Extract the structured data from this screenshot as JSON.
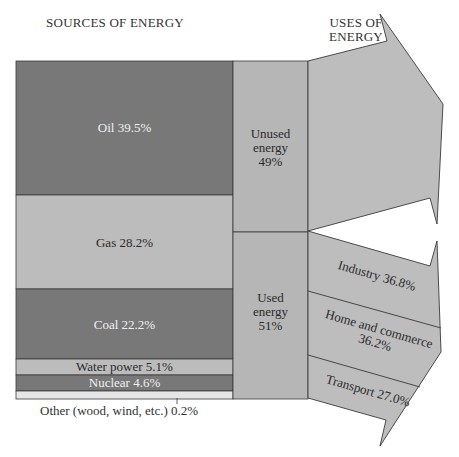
{
  "titles": {
    "sources": "SOURCES OF ENERGY",
    "uses_line1": "USES OF",
    "uses_line2": "ENERGY"
  },
  "sources": [
    {
      "name": "Oil",
      "label": "Oil 39.5%",
      "percent": 39.5,
      "color": "#787878"
    },
    {
      "name": "Gas",
      "label": "Gas 28.2%",
      "percent": 28.2,
      "color": "#bcbcbc"
    },
    {
      "name": "Coal",
      "label": "Coal 22.2%",
      "percent": 22.2,
      "color": "#787878"
    },
    {
      "name": "Water power",
      "label": "Water power 5.1%",
      "percent": 5.1,
      "color": "#bcbcbc"
    },
    {
      "name": "Nuclear",
      "label": "Nuclear 4.6%",
      "percent": 4.6,
      "color": "#787878"
    },
    {
      "name": "Other (wood, wind, etc.)",
      "label": "Other (wood, wind, etc.) 0.2%",
      "percent": 0.2,
      "color": "#e6e6e6"
    }
  ],
  "energy_split": {
    "unused": {
      "line1": "Unused",
      "line2": "energy",
      "line3": "49%",
      "percent": 49
    },
    "used": {
      "line1": "Used",
      "line2": "energy",
      "line3": "51%",
      "percent": 51
    }
  },
  "uses": [
    {
      "name": "Industry",
      "label": "Industry 36.8%",
      "percent": 36.8
    },
    {
      "name": "Home and commerce",
      "line1": "Home and commerce",
      "line2": "36.2%",
      "percent": 36.2
    },
    {
      "name": "Transport",
      "label": "Transport 27.0%",
      "percent": 27.0
    }
  ],
  "colors": {
    "dark_block": "#787878",
    "light_block": "#bcbcbc",
    "middle_column": "#b6b6b6",
    "arrow_fill": "#bdbdbd",
    "outline": "#3a3a3a"
  }
}
